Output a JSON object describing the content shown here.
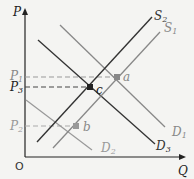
{
  "diagram": {
    "type": "supply-demand",
    "axes": {
      "y_label": "P",
      "x_label": "Q",
      "origin_label": "O"
    },
    "price_labels": [
      {
        "base": "P",
        "sub": "1",
        "color": "#888888"
      },
      {
        "base": "P",
        "sub": "3",
        "color": "#222222"
      },
      {
        "base": "P",
        "sub": "2",
        "color": "#999999"
      }
    ],
    "curves": [
      {
        "base": "S",
        "sub": "2",
        "color": "#333333"
      },
      {
        "base": "S",
        "sub": "1",
        "color": "#888888"
      },
      {
        "base": "D",
        "sub": "1",
        "color": "#888888"
      },
      {
        "base": "D",
        "sub": "2",
        "color": "#999999"
      },
      {
        "base": "D",
        "sub": "3",
        "color": "#333333"
      }
    ],
    "points": [
      {
        "label": "a",
        "color": "#888888"
      },
      {
        "label": "b",
        "color": "#888888"
      },
      {
        "label": "c",
        "color": "#222222"
      }
    ]
  }
}
